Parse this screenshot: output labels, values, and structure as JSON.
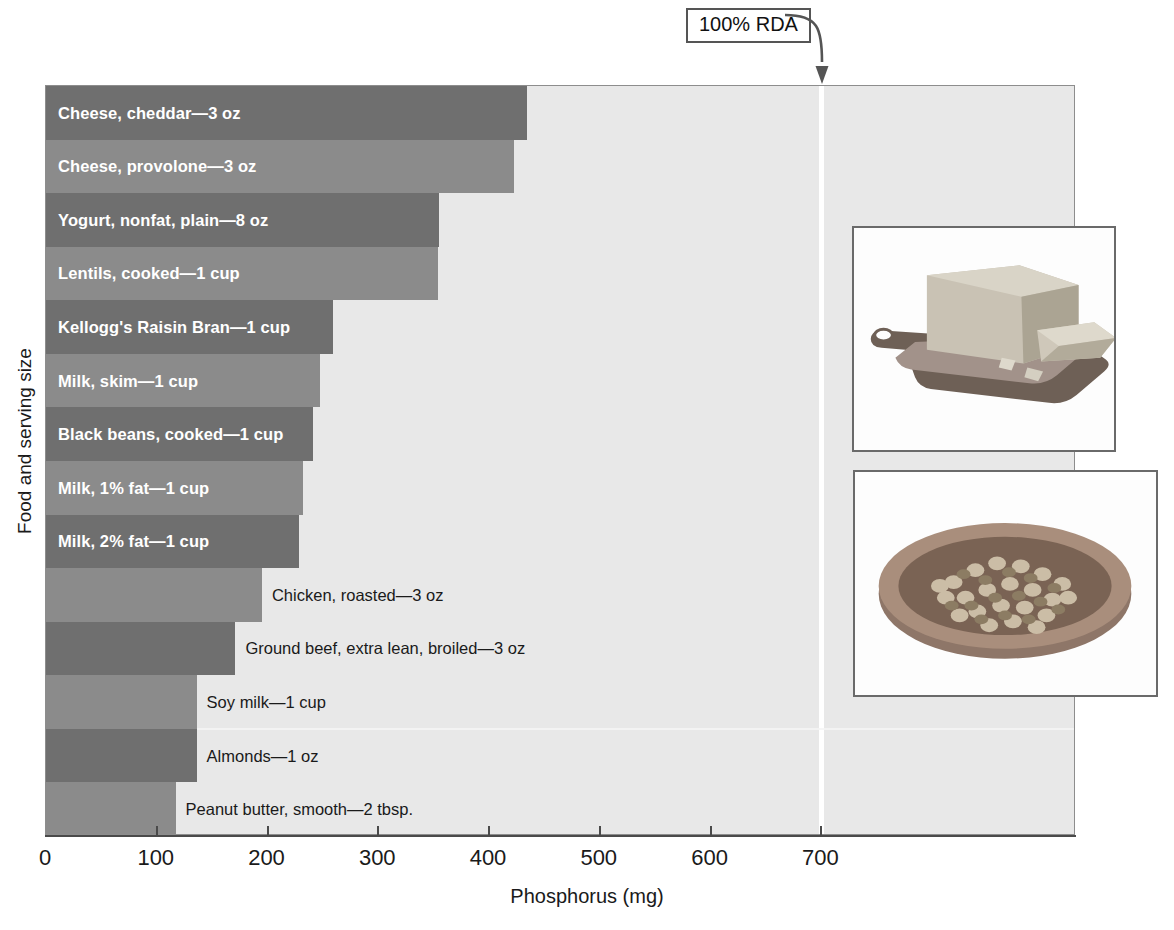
{
  "chart_data": {
    "type": "bar",
    "orientation": "horizontal",
    "title": "",
    "xlabel": "Phosphorus (mg)",
    "ylabel": "Food and serving size",
    "xlim": [
      0,
      930
    ],
    "xticks": [
      0,
      100,
      200,
      300,
      400,
      500,
      600,
      700
    ],
    "xtick_labels": [
      "0",
      "100",
      "200",
      "300",
      "400",
      "500",
      "600",
      "700"
    ],
    "grid": false,
    "legend": null,
    "categories": [
      "Cheese, cheddar—3 oz",
      "Cheese, provolone—3 oz",
      "Yogurt, nonfat, plain—8 oz",
      "Lentils, cooked—1 cup",
      "Kellogg's Raisin Bran—1 cup",
      "Milk, skim—1 cup",
      "Black beans, cooked—1 cup",
      "Milk, 1% fat—1 cup",
      "Milk, 2% fat—1 cup",
      "Chicken, roasted—3 oz",
      "Ground beef, extra lean, broiled—3 oz",
      "Soy milk—1 cup",
      "Almonds—1 oz",
      "Peanut butter, smooth—2 tbsp."
    ],
    "values": [
      434,
      423,
      355,
      354,
      259,
      247,
      241,
      232,
      228,
      195,
      171,
      136,
      136,
      117
    ],
    "bar_shades": [
      "dark",
      "light",
      "dark",
      "light",
      "dark",
      "light",
      "dark",
      "light",
      "dark",
      "light",
      "dark",
      "light",
      "dark",
      "light"
    ],
    "label_placement": [
      "inside",
      "inside",
      "inside",
      "inside",
      "inside",
      "inside",
      "inside",
      "inside",
      "inside",
      "outside",
      "outside",
      "outside",
      "outside",
      "outside"
    ],
    "annotations": [
      {
        "text": "100% RDA",
        "value": 700,
        "style": "boxed-arrow"
      }
    ]
  },
  "axes": {
    "x_title": "Phosphorus (mg)",
    "y_title": "Food and serving size"
  },
  "annotation": {
    "rda_label": "100% RDA"
  },
  "photos": [
    {
      "name": "cheddar-cheese-photo",
      "alt": "Block of cheddar cheese on a wooden board"
    },
    {
      "name": "beans-bowl-photo",
      "alt": "Bowl of dried beans"
    }
  ],
  "colors": {
    "bar_dark": "#6f6f6f",
    "bar_light": "#8b8b8b",
    "plot_background": "#e8e8e8",
    "rda_line": "#ffffff",
    "axis": "#4a4a4a",
    "text": "#1a1a1a",
    "inside_label_text": "#ffffff"
  }
}
